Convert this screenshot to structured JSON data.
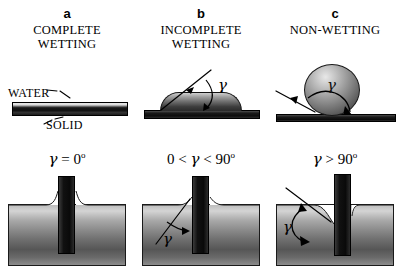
{
  "figure": {
    "caption_letters": [
      "a",
      "b",
      "c"
    ],
    "symbol_gamma": "γ"
  },
  "panels": [
    {
      "letter": "a",
      "title_line1": "COMPLETE",
      "title_line2": "WETTING",
      "top_labels": {
        "water": "WATER",
        "solid": "SOLID"
      },
      "equation_plain": "γ = 0º",
      "equation_parts": {
        "prefix": "",
        "gamma": "γ",
        "operator": " = 0",
        "degree": "o"
      },
      "contact_angle_deg": 0,
      "description": "Liquid film spreads completely over the solid; meniscus climbs the plate."
    },
    {
      "letter": "b",
      "title_line1": "INCOMPLETE",
      "title_line2": "WETTING",
      "top_labels": {
        "angle": "γ"
      },
      "equation_plain": "0 < γ < 90º",
      "equation_parts": {
        "prefix": "0 < ",
        "gamma": "γ",
        "operator": " < 90",
        "degree": "o"
      },
      "contact_angle_deg": 45,
      "description": "Droplet forms a low dome; contact angle between 0 and 90 degrees."
    },
    {
      "letter": "c",
      "title_line1": "NON-WETTING",
      "title_line2": "",
      "top_labels": {
        "angle": "γ"
      },
      "equation_plain": "γ > 90º",
      "equation_parts": {
        "prefix": "",
        "gamma": "γ",
        "operator": " > 90",
        "degree": "o"
      },
      "contact_angle_deg": 135,
      "description": "Droplet beads into a sphere; meniscus is depressed at the plate."
    }
  ],
  "colors": {
    "background": "#ffffff",
    "ink": "#000000",
    "solid_dark": "#111111",
    "liquid_mid": "#8a8a8a",
    "liquid_light": "#d4d4d4"
  }
}
